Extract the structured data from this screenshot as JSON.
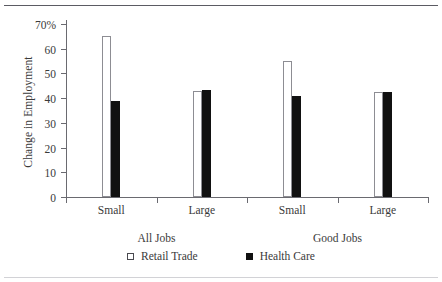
{
  "chart_data": {
    "type": "bar",
    "title": "",
    "subtitle": "",
    "xlabel": "",
    "ylabel": "Change in Employment",
    "ylim": [
      0,
      70
    ],
    "yticks": [
      0,
      10,
      20,
      30,
      40,
      50,
      60,
      70
    ],
    "ytick_labels": [
      "0",
      "10",
      "20",
      "30",
      "40",
      "50",
      "60",
      "70%"
    ],
    "grid": false,
    "legend_position": "bottom-center",
    "categories": [
      "Small",
      "Large",
      "Small",
      "Large"
    ],
    "group_labels": [
      "All Jobs",
      "Good Jobs"
    ],
    "series": [
      {
        "name": "Retail Trade",
        "style": "hollow",
        "color": "#ffffff",
        "edge_color": "#8d8d93",
        "values": [
          65,
          43,
          55,
          42.5
        ]
      },
      {
        "name": "Health Care",
        "style": "filled",
        "color": "#111111",
        "edge_color": "#111111",
        "values": [
          39,
          43.5,
          41,
          42.5
        ]
      }
    ],
    "axis_color": "#6a6a70",
    "text_color": "#3a3a3a"
  },
  "legend": {
    "items": [
      {
        "label": "Retail Trade",
        "swatch": "hollow-square-icon"
      },
      {
        "label": "Health Care",
        "swatch": "filled-square-icon"
      }
    ]
  },
  "decorations": {
    "top_rule_color": "#5b5b63",
    "bottom_rule_color": "#d2d2d6"
  }
}
